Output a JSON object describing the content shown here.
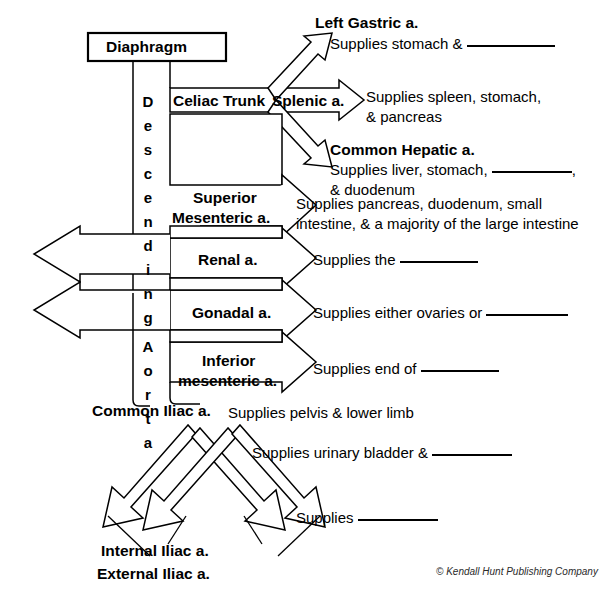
{
  "diagram": {
    "copyright": "© Kendall Hunt Publishing Company",
    "vertical_label_1": "Descending",
    "vertical_label_2": "Aorta",
    "stroke_color": "#000000",
    "background_color": "#ffffff"
  },
  "boxes": {
    "diaphragm": "Diaphragm",
    "celiac_trunk": "Celiac Trunk",
    "splenic": "Splenic a.",
    "superior_mesenteric_line1": "Superior",
    "superior_mesenteric_line2": "Mesenteric a.",
    "renal": "Renal a.",
    "gonadal": "Gonadal a.",
    "inferior_mesenteric_line1": "Inferior",
    "inferior_mesenteric_line2": "mesenteric a.",
    "common_iliac": "Common Iliac a.",
    "internal_iliac": "Internal Iliac a.",
    "external_iliac": "External Iliac a."
  },
  "branch_labels": {
    "left_gastric": "Left Gastric a.",
    "common_hepatic": "Common Hepatic a."
  },
  "descriptions": {
    "left_gastric_pre": "Supplies stomach &",
    "left_gastric_blank": true,
    "splenic_line1": "Supplies spleen, stomach,",
    "splenic_line2": "& pancreas",
    "common_hepatic_pre": "Supplies liver, stomach,",
    "common_hepatic_post": ",",
    "common_hepatic_line2": "& duodenum",
    "superior_mesenteric_line1": "Supplies pancreas, duodenum, small",
    "superior_mesenteric_line2": "intestine, & a majority of the large intestine",
    "renal_pre": "Supplies the",
    "gonadal_pre": "Supplies either ovaries or",
    "inferior_mesenteric_pre": "Supplies end of",
    "common_iliac": "Supplies pelvis & lower limb",
    "internal_iliac_pre": "Supplies urinary bladder &",
    "external_iliac_pre": "Supplies"
  },
  "vertical_letters_descending": [
    "D",
    "e",
    "s",
    "c",
    "e",
    "n",
    "d",
    "i",
    "n",
    "g"
  ],
  "vertical_letters_aorta": [
    "A",
    "o",
    "r",
    "t",
    "a"
  ]
}
